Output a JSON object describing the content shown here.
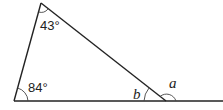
{
  "diagram": {
    "type": "triangle-exterior-angle",
    "angles": {
      "top": "43°",
      "bottom_left": "84°",
      "interior_right": "b",
      "exterior_right": "a"
    },
    "colors": {
      "line": "#222222",
      "background": "#ffffff"
    }
  }
}
